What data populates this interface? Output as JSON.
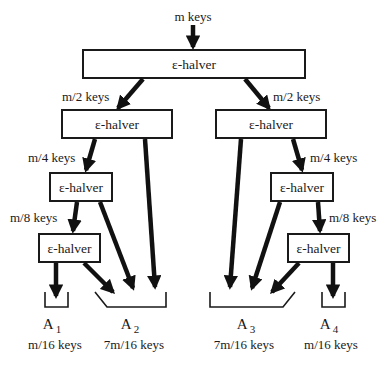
{
  "diagram": {
    "type": "recursive-halver-network",
    "input_label": "m keys",
    "node_label": "ε-halver",
    "levels": [
      {
        "level": 0,
        "label_left": "",
        "label_right": ""
      },
      {
        "level": 1,
        "label_left": "m/2 keys",
        "label_right": "m/2 keys"
      },
      {
        "level": 2,
        "label_left": "m/4 keys",
        "label_right": "m/4 keys"
      },
      {
        "level": 3,
        "label_left": "m/8 keys",
        "label_right": "m/8 keys"
      }
    ],
    "nodes": [
      {
        "id": "top",
        "label": "ε-halver"
      },
      {
        "id": "L1",
        "label": "ε-halver"
      },
      {
        "id": "R1",
        "label": "ε-halver"
      },
      {
        "id": "L2",
        "label": "ε-halver"
      },
      {
        "id": "R2",
        "label": "ε-halver"
      },
      {
        "id": "L3",
        "label": "ε-halver"
      },
      {
        "id": "R3",
        "label": "ε-halver"
      }
    ],
    "buckets": [
      {
        "name": "A",
        "index": "1",
        "size": "m/16 keys"
      },
      {
        "name": "A",
        "index": "2",
        "size": "7m/16 keys"
      },
      {
        "name": "A",
        "index": "3",
        "size": "7m/16 keys"
      },
      {
        "name": "A",
        "index": "4",
        "size": "m/16 keys"
      }
    ],
    "edges": [
      {
        "from": "input",
        "to": "top"
      },
      {
        "from": "top",
        "to": "L1",
        "label": "m/2 keys"
      },
      {
        "from": "top",
        "to": "R1",
        "label": "m/2 keys"
      },
      {
        "from": "L1",
        "to": "L2",
        "label": "m/4 keys"
      },
      {
        "from": "L1",
        "to": "A2"
      },
      {
        "from": "R1",
        "to": "R2",
        "label": "m/4 keys"
      },
      {
        "from": "R1",
        "to": "A3"
      },
      {
        "from": "L2",
        "to": "L3",
        "label": "m/8 keys"
      },
      {
        "from": "L2",
        "to": "A2"
      },
      {
        "from": "R2",
        "to": "R3",
        "label": "m/8 keys"
      },
      {
        "from": "R2",
        "to": "A3"
      },
      {
        "from": "L3",
        "to": "A1"
      },
      {
        "from": "L3",
        "to": "A2"
      },
      {
        "from": "R3",
        "to": "A3"
      },
      {
        "from": "R3",
        "to": "A4"
      }
    ]
  }
}
